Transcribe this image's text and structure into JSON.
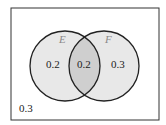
{
  "diagram": {
    "type": "venn",
    "sets": [
      {
        "name": "E",
        "only_value": "0.2"
      },
      {
        "name": "F",
        "only_value": "0.3"
      }
    ],
    "intersection_value": "0.2",
    "outside_value": "0.3",
    "colors": {
      "circle_fill": "#e6e6e6",
      "intersection_fill": "#cfcfcf",
      "stroke": "#222222",
      "label": "#888888"
    }
  }
}
